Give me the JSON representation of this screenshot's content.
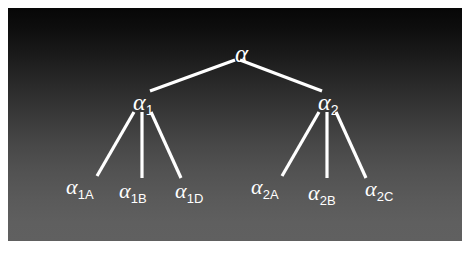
{
  "diagram": {
    "background": {
      "panel_top_color": "#070707",
      "panel_bottom_color": "#606060",
      "outer_color": "#ffffff",
      "line_color": "#ffffff",
      "text_color": "#ffffff"
    },
    "nodes": [
      {
        "id": "root",
        "base": "α",
        "sub": "",
        "x": 227,
        "y": 33,
        "level": "root"
      },
      {
        "id": "a1",
        "base": "α",
        "sub": "1",
        "x": 125,
        "y": 82,
        "level": "level1"
      },
      {
        "id": "a2",
        "base": "α",
        "sub": "2",
        "x": 310,
        "y": 82,
        "level": "level1"
      },
      {
        "id": "a1A",
        "base": "α",
        "sub": "1A",
        "x": 58,
        "y": 168,
        "level": "leaf"
      },
      {
        "id": "a1B",
        "base": "α",
        "sub": "1B",
        "x": 111,
        "y": 172,
        "level": "leaf"
      },
      {
        "id": "a1D",
        "base": "α",
        "sub": "1D",
        "x": 167,
        "y": 172,
        "level": "leaf"
      },
      {
        "id": "a2A",
        "base": "α",
        "sub": "2A",
        "x": 243,
        "y": 168,
        "level": "leaf"
      },
      {
        "id": "a2B",
        "base": "α",
        "sub": "2B",
        "x": 300,
        "y": 174,
        "level": "leaf"
      },
      {
        "id": "a2C",
        "base": "α",
        "sub": "2C",
        "x": 357,
        "y": 170,
        "level": "leaf"
      }
    ],
    "edges": [
      {
        "from": "root",
        "to": "a1",
        "x1": 227,
        "y1": 52,
        "x2": 142,
        "y2": 83
      },
      {
        "from": "root",
        "to": "a2",
        "x1": 232,
        "y1": 52,
        "x2": 314,
        "y2": 83
      },
      {
        "from": "a1",
        "to": "a1A",
        "x1": 126,
        "y1": 104,
        "x2": 89,
        "y2": 168
      },
      {
        "from": "a1",
        "to": "a1B",
        "x1": 134,
        "y1": 104,
        "x2": 134,
        "y2": 170
      },
      {
        "from": "a1",
        "to": "a1D",
        "x1": 143,
        "y1": 104,
        "x2": 173,
        "y2": 170
      },
      {
        "from": "a2",
        "to": "a2A",
        "x1": 311,
        "y1": 104,
        "x2": 274,
        "y2": 168
      },
      {
        "from": "a2",
        "to": "a2B",
        "x1": 319,
        "y1": 104,
        "x2": 319,
        "y2": 170
      },
      {
        "from": "a2",
        "to": "a2C",
        "x1": 328,
        "y1": 104,
        "x2": 358,
        "y2": 170
      }
    ]
  }
}
